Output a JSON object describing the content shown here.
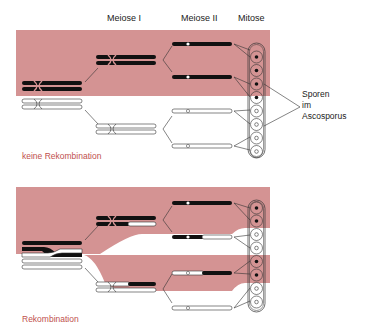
{
  "headers": {
    "meiose1": "Meiose I",
    "meiose2": "Meiose II",
    "mitose": "Mitose"
  },
  "spore_label": {
    "line1": "Sporen",
    "line2": "im",
    "line3": "Ascosporus"
  },
  "panels": [
    {
      "caption": "keine Rekombination",
      "spores": [
        "dark",
        "dark",
        "dark",
        "dark",
        "light",
        "light",
        "light",
        "light"
      ]
    },
    {
      "caption": "Rekombination",
      "spores": [
        "dark",
        "dark",
        "light",
        "light",
        "dark",
        "dark",
        "light",
        "light"
      ]
    }
  ],
  "colors": {
    "band": "#d49393",
    "caption": "#c0504d",
    "chromosome_dark": "#111111",
    "outline": "#333333"
  }
}
